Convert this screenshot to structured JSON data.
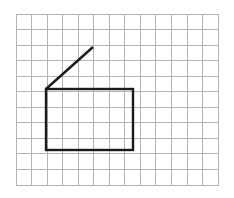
{
  "figure": {
    "background_color": "#ffffff",
    "width": 234,
    "height": 198
  },
  "chart_data": {
    "type": "scatter",
    "title": "",
    "subtitle": "",
    "xlabel": "",
    "ylabel": "",
    "grid": true,
    "legend_position": "none",
    "xlim": [
      0,
      13
    ],
    "ylim": [
      0,
      11
    ],
    "tick_labels_x": [],
    "tick_labels_y": [],
    "annotations": [],
    "grid_spec": {
      "columns": 13,
      "rows": 11,
      "cell_size_px": 15.55,
      "origin_x_px": 16,
      "origin_y_px": 14,
      "right_x_px": 218,
      "bottom_y_px": 186,
      "line_color": "#b4b4b4",
      "line_width_px": 1
    },
    "shapes": [
      {
        "name": "rectangle",
        "type": "rectangle",
        "stroke_color": "#1a1a1a",
        "stroke_width_px": 2.4,
        "fill": "none",
        "x_px": 46,
        "y_px": 89,
        "width_px": 87,
        "height_px": 61,
        "corners_px": [
          [
            46,
            89
          ],
          [
            133,
            89
          ],
          [
            133,
            150
          ],
          [
            46,
            150
          ]
        ],
        "grid_units": {
          "x": 2,
          "y": 5,
          "width": 5.6,
          "height": 4
        }
      },
      {
        "name": "diagonal-segment",
        "type": "line",
        "stroke_color": "#1a1a1a",
        "stroke_width_px": 2.4,
        "x1_px": 46,
        "y1_px": 89,
        "x2_px": 93,
        "y2_px": 47,
        "grid_units": {
          "x1": 2,
          "y1": 5,
          "x2": 5,
          "y2": 2.3
        }
      }
    ]
  }
}
